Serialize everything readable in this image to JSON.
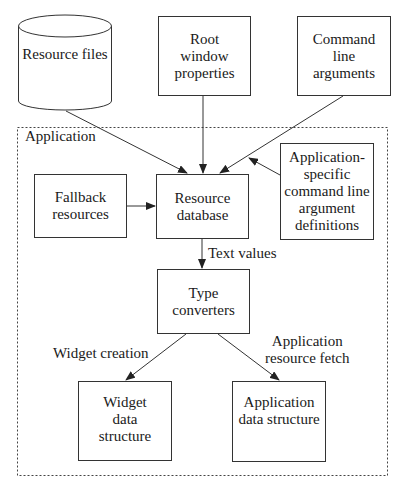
{
  "diagram": {
    "container": {
      "label": "Application"
    },
    "nodes": {
      "resource_files": {
        "lines": [
          "Resource",
          "files"
        ],
        "shape": "cylinder"
      },
      "root_window": {
        "lines": [
          "Root",
          "window",
          "properties"
        ]
      },
      "command_line": {
        "lines": [
          "Command",
          "line",
          "arguments"
        ]
      },
      "fallback": {
        "lines": [
          "Fallback",
          "resources"
        ]
      },
      "resource_db": {
        "lines": [
          "Resource",
          "database"
        ]
      },
      "app_specific": {
        "lines": [
          "Application-",
          "specific",
          "command line",
          "argument",
          "definitions"
        ]
      },
      "type_converters": {
        "lines": [
          "Type",
          "converters"
        ]
      },
      "widget_data": {
        "lines": [
          "Widget",
          "data",
          "structure"
        ]
      },
      "app_data": {
        "lines": [
          "Application",
          "data structure"
        ]
      }
    },
    "edge_labels": {
      "text_values": "Text values",
      "widget_creation": "Widget creation",
      "app_fetch": [
        "Application",
        "resource fetch"
      ]
    },
    "edges": [
      {
        "from": "resource_files",
        "to": "resource_db"
      },
      {
        "from": "root_window",
        "to": "resource_db"
      },
      {
        "from": "command_line",
        "to": "resource_db"
      },
      {
        "from": "app_specific",
        "to": "resource_db"
      },
      {
        "from": "fallback",
        "to": "resource_db"
      },
      {
        "from": "resource_db",
        "to": "type_converters",
        "label": "Text values"
      },
      {
        "from": "type_converters",
        "to": "widget_data",
        "label": "Widget creation"
      },
      {
        "from": "type_converters",
        "to": "app_data",
        "label": "Application resource fetch"
      }
    ]
  }
}
